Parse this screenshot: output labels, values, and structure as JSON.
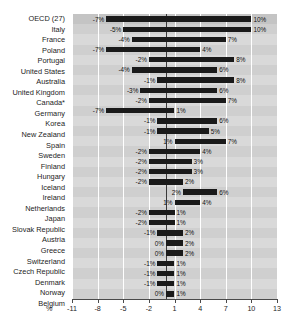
{
  "chart_data": {
    "type": "bar",
    "subtype": "horizontal-range-bar",
    "title": "",
    "xlabel": "%",
    "ylabel": "",
    "xlim": [
      -11,
      13
    ],
    "xticks": [
      -11,
      -8,
      -5,
      -2,
      1,
      4,
      7,
      10,
      13
    ],
    "xtick_labels": [
      "-11",
      "-8",
      "-5",
      "-2",
      "1",
      "4",
      "7",
      "10",
      "13"
    ],
    "grid": true,
    "zero_line": true,
    "legend": "none",
    "value_label_suffix": "%",
    "categories": [
      "OECD (27)",
      "Italy",
      "France",
      "Poland",
      "Portugal",
      "United States",
      "Australia",
      "United Kingdom",
      "Canada*",
      "Germany",
      "Korea",
      "New Zealand",
      "Spain",
      "Sweden",
      "Finland",
      "Hungary",
      "Iceland",
      "Ireland",
      "Netherlands",
      "Japan",
      "Slovak Republic",
      "Austria",
      "Greece",
      "Switzerland",
      "Czech Republic",
      "Denmark",
      "Norway",
      "Belgium"
    ],
    "series": [
      {
        "name": "low",
        "values": [
          -7,
          -5,
          -4,
          -7,
          -2,
          -4,
          -1,
          -3,
          -2,
          -7,
          -1,
          -1,
          1,
          -2,
          -2,
          -2,
          -2,
          2,
          1,
          -2,
          -2,
          -1,
          0,
          0,
          -1,
          -1,
          -1,
          0
        ]
      },
      {
        "name": "high",
        "values": [
          10,
          10,
          7,
          4,
          8,
          6,
          8,
          6,
          7,
          1,
          6,
          5,
          7,
          4,
          3,
          3,
          2,
          6,
          4,
          1,
          1,
          2,
          2,
          2,
          1,
          1,
          1,
          1
        ]
      }
    ],
    "low_labels": [
      "-7%",
      "-5%",
      "-4%",
      "-7%",
      "-2%",
      "-4%",
      "-1%",
      "-3%",
      "-2%",
      "-7%",
      "-1%",
      "-1%",
      "1%",
      "-2%",
      "-2%",
      "-2%",
      "-2%",
      "2%",
      "1%",
      "-2%",
      "-2%",
      "-1%",
      "0%",
      "0%",
      "-1%",
      "-1%",
      "-1%",
      "0%"
    ],
    "high_labels": [
      "10%",
      "10%",
      "7%",
      "4%",
      "8%",
      "6%",
      "8%",
      "6%",
      "7%",
      "1%",
      "6%",
      "5%",
      "7%",
      "4%",
      "3%",
      "3%",
      "2%",
      "6%",
      "4%",
      "1%",
      "1%",
      "2%",
      "2%",
      "2%",
      "1%",
      "1%",
      "1%",
      "1%"
    ]
  },
  "colors": {
    "bar": "#1a1a1a",
    "band_odd": "#d9d9d9",
    "band_even": "#cfcfcf",
    "band_header": "#c4c4c4",
    "gridline": "#ffffff",
    "zero_line": "#3a3a3a",
    "axis": "#4a4a4a",
    "text": "#1d1d1d"
  }
}
